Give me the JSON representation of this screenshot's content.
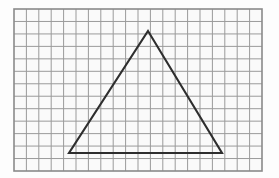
{
  "figure": {
    "title": "Triangle drawn on square grid paper",
    "canvas": {
      "width": 279,
      "height": 178
    },
    "background_color": "#fdfdfd"
  },
  "grid": {
    "name": "graph-paper-grid",
    "x": 14,
    "y": 9,
    "width": 248,
    "height": 162,
    "columns": 20,
    "rows": 13,
    "cell_width": 12.4,
    "cell_height": 12.46,
    "line_color": "#9a9a9a",
    "line_width": 1,
    "border_color": "#8a8a8a",
    "border_width": 1.6,
    "cell_fill": "#fafafa"
  },
  "chart_data": {
    "type": "scatter",
    "xlabel": "",
    "ylabel": "",
    "xlim": [
      0,
      20
    ],
    "ylim": [
      0,
      13
    ],
    "grid": true,
    "legend_position": "none",
    "shapes": [
      {
        "name": "triangle",
        "kind": "polygon",
        "closed": true,
        "stroke_color": "#2e2e2e",
        "stroke_width": 2.1,
        "fill": "none",
        "vertices_px": [
          {
            "label": "apex",
            "x": 148,
            "y": 31
          },
          {
            "label": "bottom-right",
            "x": 222,
            "y": 153
          },
          {
            "label": "bottom-left",
            "x": 69,
            "y": 153
          }
        ],
        "vertices_grid": [
          {
            "label": "apex",
            "col": 10.8,
            "row": 1.8
          },
          {
            "label": "bottom-right",
            "col": 16.8,
            "row": 11.6
          },
          {
            "label": "bottom-left",
            "col": 4.4,
            "row": 11.6
          }
        ],
        "base_length_cells": 12.4,
        "height_cells": 9.8
      }
    ]
  }
}
